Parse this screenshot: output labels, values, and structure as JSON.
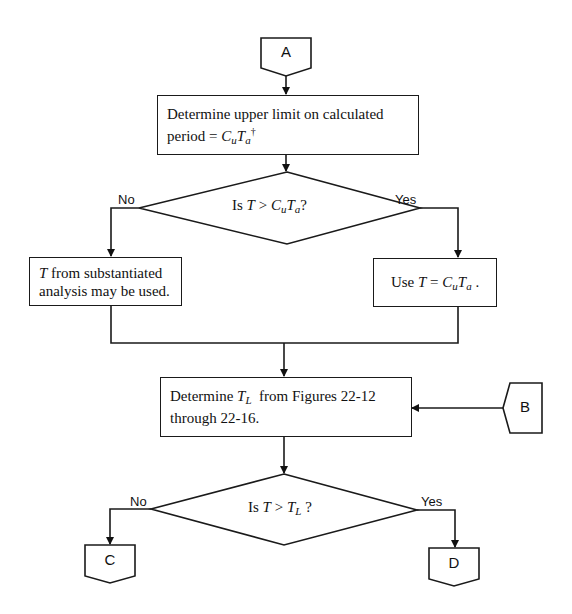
{
  "connectors": {
    "a": "A",
    "b": "B",
    "c": "C",
    "d": "D"
  },
  "steps": {
    "upper_limit": {
      "line1": "Determine upper limit on calculated",
      "line2_prefix": "period = ",
      "var1": "C",
      "var1_sub": "u",
      "var2": "T",
      "var2_sub": "a",
      "footnote_mark": "†"
    },
    "substantiated": {
      "var": "T",
      "line1_rest": " from substantiated",
      "line2": "analysis may be used."
    },
    "use_cuta": {
      "prefix": "Use ",
      "var_t": "T",
      "eq": " = ",
      "var1": "C",
      "var1_sub": "u",
      "var2": "T",
      "var2_sub": "a",
      "suffix": " ."
    },
    "determine_tl": {
      "prefix": "Determine ",
      "var": "T",
      "var_sub": "L",
      "line1_rest": "  from Figures 22-12",
      "line2": "through 22-16."
    }
  },
  "decisions": {
    "d1": {
      "prefix": "Is ",
      "var_t": "T",
      "op": " > ",
      "var1": "C",
      "var1_sub": "u",
      "var2": "T",
      "var2_sub": "a",
      "suffix": "?",
      "no_label": "No",
      "yes_label": "Yes"
    },
    "d2": {
      "prefix": "Is ",
      "var_t": "T",
      "op": " > ",
      "var": "T",
      "var_sub": "L",
      "suffix": " ?",
      "no_label": "No",
      "yes_label": "Yes"
    }
  }
}
